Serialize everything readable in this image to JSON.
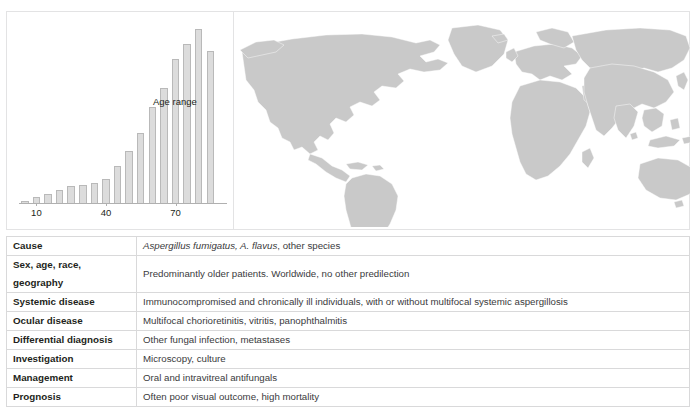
{
  "chart_data": {
    "type": "bar",
    "title": "",
    "annotation": "Age range",
    "xlabel": "",
    "ylabel": "",
    "x": [
      5,
      10,
      15,
      20,
      25,
      30,
      35,
      40,
      45,
      50,
      55,
      60,
      65,
      70,
      75,
      80,
      85
    ],
    "tick_labels": [
      "10",
      "40",
      "70"
    ],
    "tick_x": [
      10,
      40,
      70
    ],
    "categories": [
      "5",
      "10",
      "15",
      "20",
      "25",
      "30",
      "35",
      "40",
      "45",
      "50",
      "55",
      "60",
      "65",
      "70",
      "75",
      "80",
      "85"
    ],
    "values": [
      1,
      3,
      5,
      7,
      9,
      10,
      11,
      13,
      20,
      28,
      38,
      52,
      62,
      78,
      86,
      94,
      82
    ],
    "ylim": [
      0,
      100
    ],
    "grid": false,
    "legend": "none",
    "bar_color": "#dcdcdc",
    "bar_border_color": "#b9b9b9"
  },
  "map": {
    "name": "world-distribution-map",
    "description": "Worldwide distribution highlighted",
    "highlight_color": "#c9c9c9",
    "background_color": "#ffffff"
  },
  "table": {
    "rows": [
      {
        "label": "Cause",
        "value": "Aspergillus fumigatus, A. flavus, other species",
        "italic_prefix": "Aspergillus fumigatus, A. flavus",
        "plain_suffix": ", other species",
        "has_italic": true
      },
      {
        "label": "Sex, age, race, geography",
        "value": "Predominantly older patients. Worldwide, no other predilection",
        "has_italic": false
      },
      {
        "label": "Systemic disease",
        "value": "Immunocompromised and chronically ill individuals, with or without multifocal systemic aspergillosis",
        "has_italic": false
      },
      {
        "label": "Ocular disease",
        "value": "Multifocal chorioretinitis, vitritis, panophthalmitis",
        "has_italic": false
      },
      {
        "label": "Differential diagnosis",
        "value": "Other fungal infection, metastases",
        "has_italic": false
      },
      {
        "label": "Investigation",
        "value": "Microscopy, culture",
        "has_italic": false
      },
      {
        "label": "Management",
        "value": "Oral and intravitreal antifungals",
        "has_italic": false
      },
      {
        "label": "Prognosis",
        "value": "Often poor visual outcome, high mortality",
        "has_italic": false
      }
    ]
  },
  "colors": {
    "border": "#e3e3e4",
    "table_border": "#d9d9da",
    "text": "#231f20",
    "value_text": "#3a3a3c"
  }
}
